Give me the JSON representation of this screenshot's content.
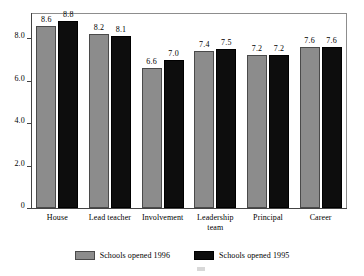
{
  "chart_data": {
    "type": "bar",
    "title": "",
    "subtitle": "",
    "xlabel": "",
    "ylabel": "",
    "ylim": [
      0,
      9.2
    ],
    "grid": false,
    "legend_position": "bottom",
    "categories": [
      "House",
      "Lead teacher",
      "Involvement",
      "Leadership\nteam",
      "Principal",
      "Career"
    ],
    "y_ticks": [
      {
        "value": 0,
        "label": "0"
      },
      {
        "value": 2.0,
        "label": "2.0"
      },
      {
        "value": 4.0,
        "label": "4.0"
      },
      {
        "value": 6.0,
        "label": "6.0"
      },
      {
        "value": 8.0,
        "label": "8.0"
      }
    ],
    "series": [
      {
        "name": "Schools opened 1996",
        "color": "#8c8c8c",
        "values": [
          8.6,
          8.2,
          6.6,
          7.4,
          7.2,
          7.6
        ],
        "labels": [
          "8.6",
          "8.2",
          "6.6",
          "7.4",
          "7.2",
          "7.6"
        ]
      },
      {
        "name": "Schools opened 1995",
        "color": "#0d0d0d",
        "values": [
          8.8,
          8.1,
          7.0,
          7.5,
          7.2,
          7.6
        ],
        "labels": [
          "8.8",
          "8.1",
          "7.0",
          "7.5",
          "7.2",
          "7.6"
        ]
      }
    ]
  },
  "legend": {
    "items": [
      {
        "label": "Schools opened 1996",
        "color": "#8c8c8c"
      },
      {
        "label": "Schools opened 1995",
        "color": "#0d0d0d"
      }
    ]
  },
  "colors": {
    "series_1": "#8c8c8c",
    "series_2": "#0d0d0d",
    "axis": "#444444",
    "frame": "#8d8d8d",
    "background": "#ffffff",
    "text": "#000000"
  }
}
